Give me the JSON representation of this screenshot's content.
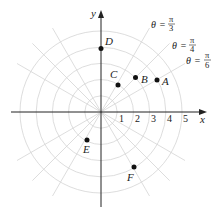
{
  "diagram": {
    "type": "polar-coordinate-grid",
    "origin_px": [
      101,
      112
    ],
    "unit_px": 16.2,
    "circle_radii": [
      1,
      2,
      3,
      4,
      5
    ],
    "ray_angles_deg": [
      30,
      45,
      60,
      120,
      135,
      150,
      210,
      225,
      240,
      300,
      315,
      330
    ],
    "axes": {
      "x_label": "x",
      "y_label": "y",
      "x_ticks": [
        "1",
        "2",
        "3",
        "4",
        "5"
      ]
    },
    "angle_labels": [
      {
        "theta": "θ",
        "eq": "=",
        "num": "π",
        "den": "3"
      },
      {
        "theta": "θ",
        "eq": "=",
        "num": "π",
        "den": "4"
      },
      {
        "theta": "θ",
        "eq": "=",
        "num": "π",
        "den": "6"
      }
    ],
    "points": [
      {
        "label": "A",
        "r": 4,
        "theta": "π/6"
      },
      {
        "label": "B",
        "r": 3,
        "theta": "π/4"
      },
      {
        "label": "C",
        "r": 2,
        "theta": "π/3"
      },
      {
        "label": "D",
        "r": 4,
        "theta": "π/2"
      },
      {
        "label": "E",
        "r": 2,
        "theta": "4π/3"
      },
      {
        "label": "F",
        "r": 4,
        "theta": "-π/3"
      }
    ]
  }
}
